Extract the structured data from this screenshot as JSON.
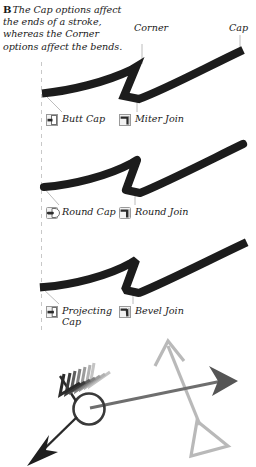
{
  "figure": {
    "letter": "B",
    "caption": "The Cap options affect the ends of a stroke, whereas the Corner options affect the bends."
  },
  "callouts": {
    "corner": "Corner",
    "cap": "Cap"
  },
  "rows": [
    {
      "stroke_style": "miter",
      "cap_option": {
        "label": "Butt Cap",
        "icon": "butt-cap-icon"
      },
      "join_option": {
        "label": "Miter Join",
        "icon": "miter-join-icon"
      }
    },
    {
      "stroke_style": "round",
      "cap_option": {
        "label": "Round Cap",
        "icon": "round-cap-icon"
      },
      "join_option": {
        "label": "Round Join",
        "icon": "round-join-icon"
      }
    },
    {
      "stroke_style": "bevel",
      "cap_option": {
        "label": "Projecting Cap",
        "icon": "projecting-cap-icon"
      },
      "join_option": {
        "label": "Bevel Join",
        "icon": "bevel-join-icon"
      }
    }
  ],
  "colors": {
    "stroke_black": "#1c1c1c",
    "leader_line": "#a8a8a8",
    "guide_dash": "#c8c8c8",
    "arrow_dark": "#4a4a4a",
    "arrow_mid": "#6e6e6e",
    "arrow_light": "#b0b0b0",
    "icon_fill": "#8c8c8c",
    "text": "#1a1a1a",
    "background": "#ffffff"
  },
  "bottom_art": {
    "name": "arrowhead-sample-illustration",
    "elements": [
      "feathered-arrowhead",
      "circle-node",
      "solid-triangle-arrowhead",
      "open-triangle-arrowhead",
      "thin-open-arrowhead"
    ]
  }
}
